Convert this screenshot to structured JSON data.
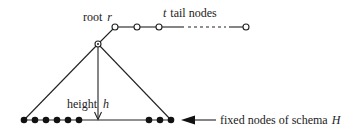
{
  "diagram": {
    "labels": {
      "root_text": "root",
      "root_var": "r",
      "tail_var": "t",
      "tail_text": "tail nodes",
      "height_text": "height",
      "height_var": "h",
      "fixed_text": "fixed nodes of schema",
      "fixed_var": "H"
    },
    "colors": {
      "stroke": "#222222",
      "background": "#ffffff"
    },
    "nodes": {
      "hub": {
        "x": 98,
        "y": 44,
        "type": "open-with-dot"
      },
      "root": {
        "x": 115,
        "y": 27,
        "type": "open"
      },
      "tail": [
        {
          "x": 137,
          "y": 27,
          "type": "open"
        },
        {
          "x": 159,
          "y": 27,
          "type": "open"
        },
        {
          "x": 246,
          "y": 27,
          "type": "open"
        }
      ],
      "fixed_left": [
        24,
        35,
        46,
        57,
        68,
        79
      ],
      "fixed_right": [
        149,
        160,
        171
      ],
      "fixed_y": 120
    }
  }
}
